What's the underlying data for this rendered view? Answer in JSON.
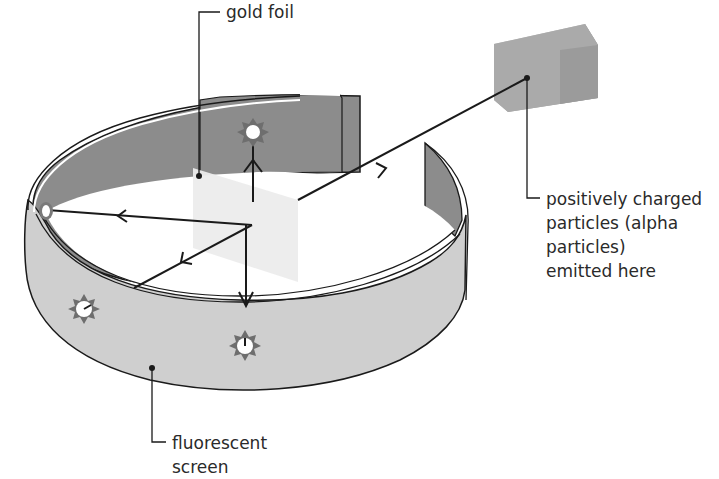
{
  "diagram": {
    "labels": {
      "gold_foil": "gold foil",
      "source_line1": "positively charged",
      "source_line2": "particles (alpha",
      "source_line3": "particles)",
      "source_line4": "emitted here",
      "screen_line1": "fluorescent",
      "screen_line2": "screen"
    },
    "components": [
      {
        "id": "source-box",
        "description": "grey block emitting alpha particles"
      },
      {
        "id": "gold-foil",
        "description": "thin translucent sheet in center"
      },
      {
        "id": "fluorescent-screen",
        "description": "circular ring screen around foil, open near source"
      }
    ],
    "particle_paths": [
      {
        "id": "incoming",
        "from": "source",
        "to": "foil"
      },
      {
        "id": "deflected-back-up",
        "to": "screen-back"
      },
      {
        "id": "deflected-left",
        "to": "screen-left-inside"
      },
      {
        "id": "deflected-down-left",
        "to": "screen-front-left"
      },
      {
        "id": "deflected-down",
        "to": "screen-front"
      }
    ],
    "flash_markers": 4,
    "colors": {
      "screen_inner": "#8a8a8a",
      "screen_outer": "#cfcfcf",
      "foil": "#ececec",
      "source": "#a9a9a9",
      "flash": "#6e6e6e",
      "line": "#1a1a1a",
      "text": "#2a2a2a"
    }
  }
}
